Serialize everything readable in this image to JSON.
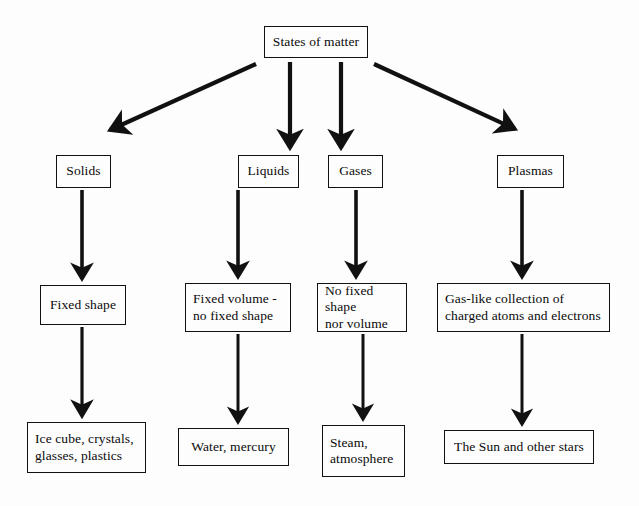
{
  "diagram": {
    "title": "States of matter",
    "background_color": "#fdfdfd",
    "line_color": "#111111",
    "text_color": "#0a0a0a",
    "root": {
      "id": "states-of-matter",
      "label": "States of matter"
    },
    "columns": [
      {
        "state": {
          "id": "solids",
          "label": "Solids"
        },
        "property": {
          "id": "fixed-shape",
          "label": "Fixed shape"
        },
        "examples": {
          "id": "ice-cube",
          "label": "Ice cube, crystals,\nglasses, plastics"
        }
      },
      {
        "state": {
          "id": "liquids",
          "label": "Liquids"
        },
        "property": {
          "id": "fixed-volume",
          "label": "Fixed volume -\nno fixed shape"
        },
        "examples": {
          "id": "water",
          "label": "Water, mercury"
        }
      },
      {
        "state": {
          "id": "gases",
          "label": "Gases"
        },
        "property": {
          "id": "no-fixed-shape",
          "label": "No fixed shape\nnor volume"
        },
        "examples": {
          "id": "steam",
          "label": "Steam,\natmosphere"
        }
      },
      {
        "state": {
          "id": "plasmas",
          "label": "Plasmas"
        },
        "property": {
          "id": "gas-like",
          "label": "Gas-like collection of\ncharged atoms and electrons"
        },
        "examples": {
          "id": "the-sun",
          "label": "The Sun and other stars"
        }
      }
    ],
    "connectors": [
      {
        "from": "states-of-matter",
        "to": "solids",
        "style": "diagonal-left"
      },
      {
        "from": "states-of-matter",
        "to": "liquids",
        "style": "vertical"
      },
      {
        "from": "states-of-matter",
        "to": "gases",
        "style": "vertical"
      },
      {
        "from": "states-of-matter",
        "to": "plasmas",
        "style": "diagonal-right"
      },
      {
        "from": "solids",
        "to": "fixed-shape",
        "style": "vertical"
      },
      {
        "from": "liquids",
        "to": "fixed-volume",
        "style": "vertical"
      },
      {
        "from": "gases",
        "to": "no-fixed-shape",
        "style": "vertical"
      },
      {
        "from": "plasmas",
        "to": "gas-like",
        "style": "vertical"
      },
      {
        "from": "fixed-shape",
        "to": "ice-cube",
        "style": "vertical"
      },
      {
        "from": "fixed-volume",
        "to": "water",
        "style": "vertical"
      },
      {
        "from": "no-fixed-shape",
        "to": "steam",
        "style": "vertical"
      },
      {
        "from": "gas-like",
        "to": "the-sun",
        "style": "vertical"
      }
    ]
  }
}
